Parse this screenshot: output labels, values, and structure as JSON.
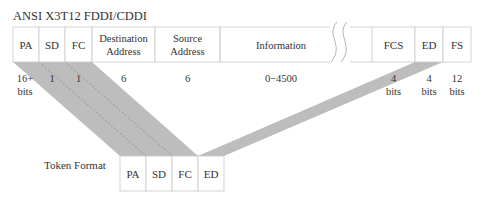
{
  "title": "ANSI X3T12 FDDI/CDDI",
  "frame_fields": [
    {
      "label1": "PA",
      "label2": "",
      "size1": "16+",
      "size2": "bits"
    },
    {
      "label1": "SD",
      "label2": "",
      "size1": "1",
      "size2": ""
    },
    {
      "label1": "FC",
      "label2": "",
      "size1": "1",
      "size2": ""
    },
    {
      "label1": "Destination",
      "label2": "Address",
      "size1": "6",
      "size2": ""
    },
    {
      "label1": "Source",
      "label2": "Address",
      "size1": "6",
      "size2": ""
    },
    {
      "label1": "Information",
      "label2": "",
      "size1": "0−4500",
      "size2": ""
    },
    {
      "label1": "FCS",
      "label2": "",
      "size1": "4",
      "size2": "bits"
    },
    {
      "label1": "ED",
      "label2": "",
      "size1": "4",
      "size2": "bits"
    },
    {
      "label1": "FS",
      "label2": "",
      "size1": "12",
      "size2": "bits"
    }
  ],
  "token": {
    "label": "Token Format",
    "fields": [
      "PA",
      "SD",
      "FC",
      "ED"
    ]
  },
  "colors": {
    "box_border": "#c8c8c8",
    "shade": "#bdbdbd",
    "text": "#333333"
  }
}
